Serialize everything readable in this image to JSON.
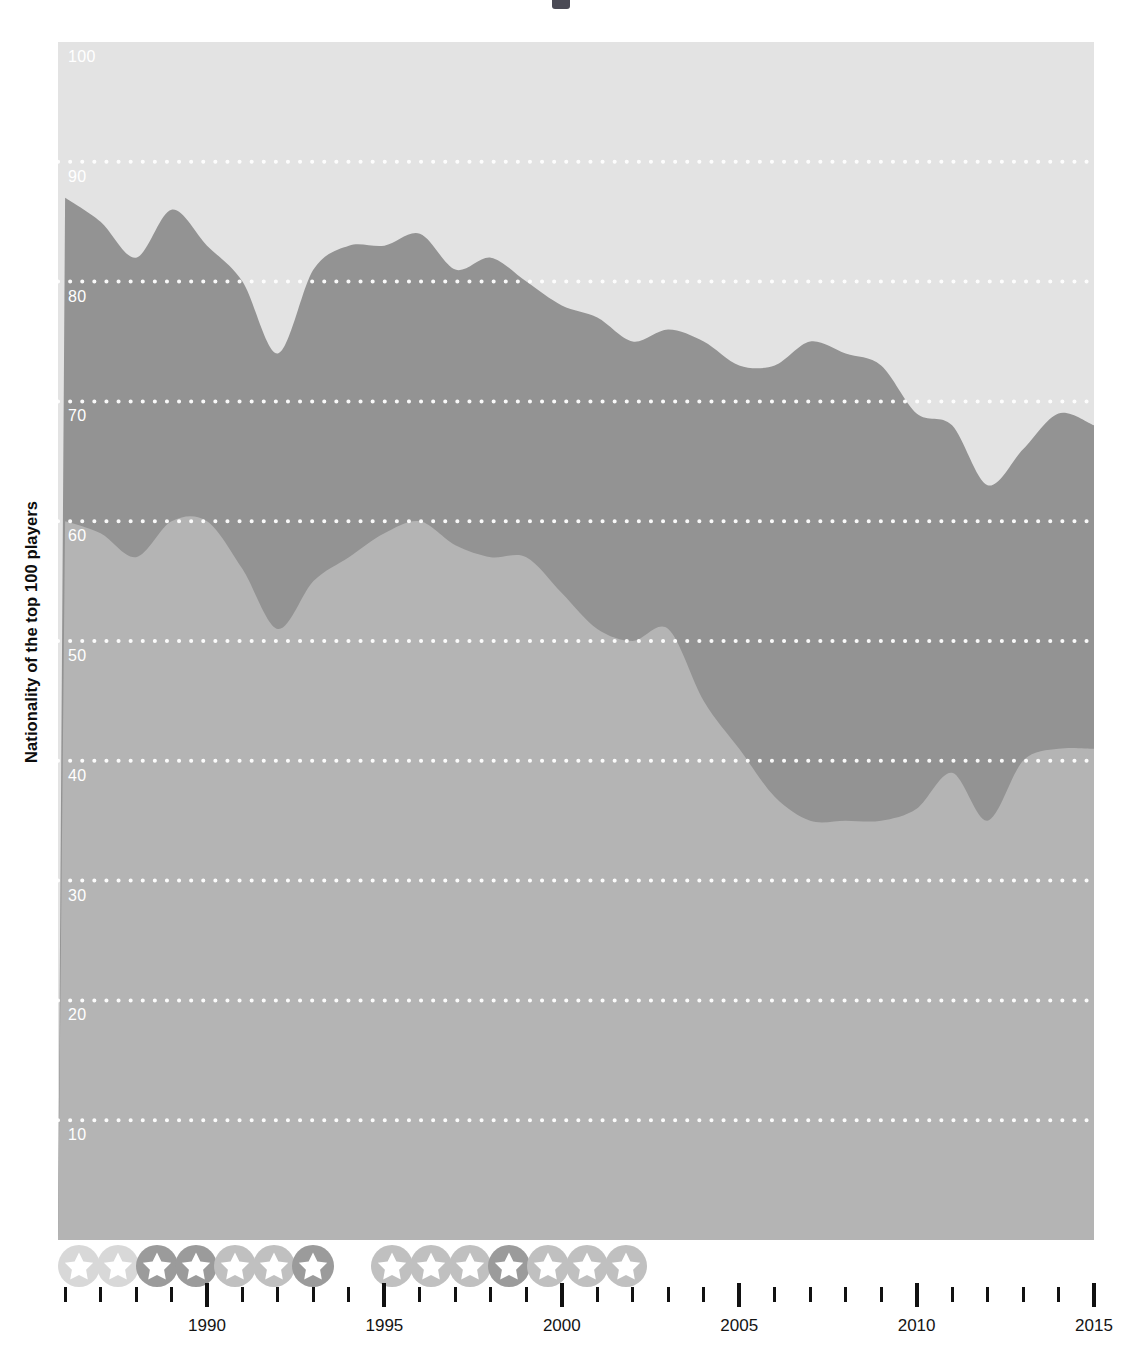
{
  "page": {
    "background": "#ffffff",
    "title_fragment": ""
  },
  "axis_title": {
    "y": "Nationality of the top 100 players"
  },
  "colors": {
    "band_top": "#e3e3e3",
    "band_middle": "#939393",
    "band_bottom": "#b4b4b4",
    "gridline": "#ffffff",
    "tick": "#111111",
    "tick_label": "#141414",
    "y_tick_label": "#ffffff",
    "star_circle_strong": "#9b9b9b",
    "star_circle_medium": "#c0c0c0",
    "star_circle_faint": "#d8d8d8",
    "star_glyph": "#ffffff"
  },
  "chart_data": {
    "type": "area",
    "stacked": true,
    "title": "",
    "xlabel": "",
    "ylabel": "Nationality of the top 100 players",
    "xlim": [
      1985.8,
      2015.0
    ],
    "ylim": [
      0,
      100
    ],
    "grid": true,
    "grid_axis": "y",
    "legend": "none",
    "ytick_labels": [
      "10",
      "20",
      "30",
      "40",
      "50",
      "60",
      "70",
      "80",
      "90",
      "100"
    ],
    "yticks": [
      10,
      20,
      30,
      40,
      50,
      60,
      70,
      80,
      90,
      100
    ],
    "xtick_labels": [
      "1990",
      "1995",
      "2000",
      "2005",
      "2010",
      "2015"
    ],
    "xticks": [
      1990,
      1995,
      2000,
      2005,
      2010,
      2015
    ],
    "xtick_minor_step": 1,
    "x": [
      1986,
      1987,
      1988,
      1989,
      1990,
      1991,
      1992,
      1993,
      1994,
      1995,
      1996,
      1997,
      1998,
      1999,
      2000,
      2001,
      2002,
      2003,
      2004,
      2005,
      2006,
      2007,
      2008,
      2009,
      2010,
      2011,
      2012,
      2013,
      2014,
      2015
    ],
    "series": [
      {
        "name": "bottom-band",
        "color": "#b4b4b4",
        "values": [
          60,
          59,
          57,
          60,
          60,
          56,
          51,
          55,
          57,
          59,
          60,
          58,
          57,
          57,
          54,
          51,
          50,
          51,
          45,
          41,
          37,
          35,
          35,
          35,
          36,
          39,
          35,
          40,
          41,
          41
        ]
      },
      {
        "name": "middle-band",
        "color": "#939393",
        "values": [
          27,
          26,
          25,
          26,
          23,
          24,
          23,
          26,
          26,
          24,
          24,
          23,
          25,
          23,
          24,
          26,
          25,
          25,
          30,
          32,
          36,
          40,
          39,
          38,
          33,
          29,
          28,
          26,
          28,
          27
        ]
      },
      {
        "name": "top-band",
        "color": "#e3e3e3",
        "values": [
          13,
          15,
          18,
          14,
          17,
          20,
          26,
          19,
          17,
          17,
          16,
          19,
          18,
          20,
          22,
          23,
          25,
          24,
          25,
          27,
          27,
          25,
          26,
          27,
          31,
          32,
          37,
          34,
          31,
          32
        ]
      }
    ],
    "cumulative_upper_boundaries": {
      "bottom_top_edge": [
        60,
        59,
        57,
        60,
        60,
        56,
        51,
        55,
        57,
        59,
        60,
        58,
        57,
        57,
        54,
        51,
        50,
        51,
        45,
        41,
        37,
        35,
        35,
        35,
        36,
        39,
        35,
        40,
        41,
        41
      ],
      "middle_top_edge": [
        87,
        85,
        82,
        86,
        83,
        80,
        74,
        81,
        83,
        83,
        84,
        81,
        82,
        80,
        78,
        77,
        75,
        76,
        75,
        73,
        73,
        75,
        74,
        73,
        69,
        68,
        63,
        66,
        69,
        68
      ]
    }
  },
  "x_axis_markers": {
    "name": "tournament-star-markers",
    "icon": "star-in-circle-icon",
    "items": [
      {
        "year": 1986.4,
        "intensity": "faint"
      },
      {
        "year": 1987.5,
        "intensity": "faint"
      },
      {
        "year": 1988.6,
        "intensity": "strong"
      },
      {
        "year": 1989.7,
        "intensity": "strong"
      },
      {
        "year": 1990.8,
        "intensity": "medium"
      },
      {
        "year": 1991.9,
        "intensity": "medium"
      },
      {
        "year": 1993.0,
        "intensity": "strong"
      },
      {
        "year": 1995.2,
        "intensity": "medium"
      },
      {
        "year": 1996.3,
        "intensity": "medium"
      },
      {
        "year": 1997.4,
        "intensity": "medium"
      },
      {
        "year": 1998.5,
        "intensity": "strong"
      },
      {
        "year": 1999.6,
        "intensity": "medium"
      },
      {
        "year": 2000.7,
        "intensity": "medium"
      },
      {
        "year": 2001.8,
        "intensity": "medium"
      }
    ]
  }
}
